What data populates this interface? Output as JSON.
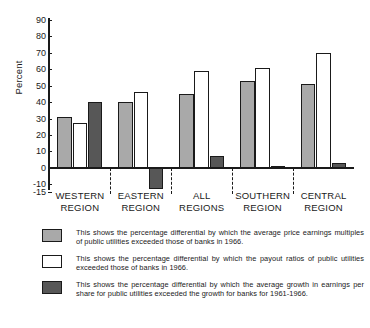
{
  "chart_data": {
    "type": "bar",
    "title": "",
    "subtitle": "",
    "xlabel": "",
    "ylabel": "Percent",
    "ylim": [
      -15,
      90
    ],
    "yticks": [
      90,
      80,
      70,
      60,
      50,
      40,
      30,
      20,
      10,
      0,
      -10,
      -15
    ],
    "ytick_labels": [
      "90",
      "80",
      "70",
      "60",
      "50",
      "40",
      "30",
      "20",
      "10",
      "0",
      "-10",
      "-15"
    ],
    "grid": false,
    "legend_position": "below",
    "categories": [
      "WESTERN\nREGION",
      "EASTERN\nREGION",
      "ALL\nREGIONS",
      "SOUTHERN\nREGION",
      "CENTRAL\nREGION"
    ],
    "category_labels": [
      {
        "line1": "WESTERN",
        "line2": "REGION"
      },
      {
        "line1": "EASTERN",
        "line2": "REGION"
      },
      {
        "line1": "ALL",
        "line2": "REGIONS"
      },
      {
        "line1": "SOUTHERN",
        "line2": "REGION"
      },
      {
        "line1": "CENTRAL",
        "line2": "REGION"
      }
    ],
    "series": [
      {
        "name": "price-earnings-multiples",
        "color": "#a9a9a9",
        "values": [
          31,
          40,
          45,
          53,
          51
        ]
      },
      {
        "name": "payout-ratios",
        "color": "#ffffff",
        "values": [
          27,
          46,
          59,
          61,
          70
        ]
      },
      {
        "name": "earnings-per-share-growth",
        "color": "#575757",
        "values": [
          40,
          -13,
          7,
          1,
          3
        ]
      }
    ]
  },
  "legend": {
    "entries": [
      {
        "swatch": "gray-swatch",
        "text": "This shows the percentage differential by which the average price earnings multiples of public utilities exceeded those of banks in 1966."
      },
      {
        "swatch": "white-swatch",
        "text": "This shows the percentage differential by which the payout ratios of public utilities exceeded those of banks in 1966."
      },
      {
        "swatch": "dark-gray-swatch",
        "text": "This shows the percentage differential by which the average growth in earnings per share for public utilities exceeded the growth for banks for 1961-1966."
      }
    ]
  },
  "colors": {
    "series_gray": "#a9a9a9",
    "series_white": "#ffffff",
    "series_dark": "#575757",
    "axis": "#1a1a1a",
    "background": "#ffffff"
  }
}
